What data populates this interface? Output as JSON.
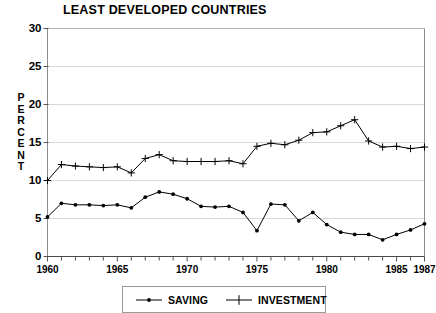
{
  "chart_data": {
    "type": "line",
    "title": "LEAST DEVELOPED COUNTRIES",
    "xlabel": "",
    "ylabel": "PERCENT",
    "ylim": [
      0,
      30
    ],
    "xlim": [
      1960,
      1987
    ],
    "yticks": [
      0,
      5,
      10,
      15,
      20,
      25,
      30
    ],
    "xticks": [
      1960,
      1965,
      1970,
      1975,
      1980,
      1985,
      1987
    ],
    "xtick_labels": [
      "1960",
      "1965",
      "1970",
      "1975",
      "1980",
      "1985",
      "1987"
    ],
    "ytick_labels": [
      "0",
      "5",
      "10",
      "15",
      "20",
      "25",
      "30"
    ],
    "grid": true,
    "legend_position": "bottom",
    "x": [
      1960,
      1961,
      1962,
      1963,
      1964,
      1965,
      1966,
      1967,
      1968,
      1969,
      1970,
      1971,
      1972,
      1973,
      1974,
      1975,
      1976,
      1977,
      1978,
      1979,
      1980,
      1981,
      1982,
      1983,
      1984,
      1985,
      1986,
      1987
    ],
    "series": [
      {
        "name": "SAVING",
        "marker": "dot",
        "color": "#000000",
        "values": [
          5.2,
          7.0,
          6.8,
          6.8,
          6.7,
          6.8,
          6.4,
          7.8,
          8.5,
          8.2,
          7.6,
          6.6,
          6.5,
          6.6,
          5.8,
          3.4,
          6.9,
          6.8,
          4.7,
          5.8,
          4.2,
          3.2,
          2.9,
          2.9,
          2.2,
          2.9,
          3.5,
          4.3
        ]
      },
      {
        "name": "INVESTMENT",
        "marker": "plus",
        "color": "#000000",
        "values": [
          10.0,
          12.1,
          11.9,
          11.8,
          11.7,
          11.8,
          11.0,
          12.9,
          13.4,
          12.6,
          12.5,
          12.5,
          12.5,
          12.6,
          12.2,
          14.5,
          14.9,
          14.7,
          15.3,
          16.3,
          16.4,
          17.2,
          18.0,
          15.2,
          14.4,
          14.5,
          14.2,
          14.4
        ]
      }
    ]
  },
  "legend": {
    "saving_label": "SAVING",
    "investment_label": "INVESTMENT"
  }
}
